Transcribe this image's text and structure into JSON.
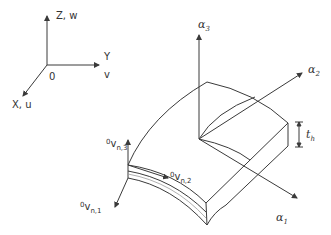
{
  "global_axes": {
    "z_label": "Z, w",
    "y_label": "Y",
    "y_sub_label": "v",
    "x_label": "X, u",
    "origin_label": "0"
  },
  "local_axes": {
    "alpha3": {
      "symbol": "α",
      "index": "3"
    },
    "alpha2": {
      "symbol": "α",
      "index": "2"
    },
    "alpha1": {
      "symbol": "α",
      "index": "1"
    }
  },
  "thickness": {
    "symbol": "t",
    "index": "h"
  },
  "director_vectors": {
    "v3": {
      "pre": "0",
      "symbol": "v",
      "index": "n,3"
    },
    "v2": {
      "pre": "0",
      "symbol": "v",
      "index": "n,2"
    },
    "v1": {
      "pre": "0",
      "symbol": "v",
      "index": "n,1"
    }
  },
  "colors": {
    "line": "#3a3a3a",
    "midline": "#9a9a9a",
    "background": "#ffffff"
  }
}
